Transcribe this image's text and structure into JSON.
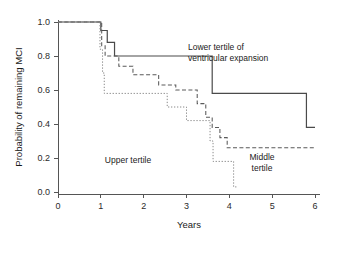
{
  "chart_data": {
    "type": "line",
    "title": "",
    "subtitle": "",
    "xlabel": "Years",
    "ylabel": "Probability of remaining MCI",
    "xlim": [
      0,
      6.3
    ],
    "ylim": [
      0,
      1.05
    ],
    "xticks": [
      0,
      1,
      2,
      3,
      4,
      5,
      6
    ],
    "xtick_labels": [
      "0",
      "1",
      "2",
      "3",
      "4",
      "5",
      "6"
    ],
    "yticks": [
      0.0,
      0.2,
      0.4,
      0.6,
      0.8,
      1.0
    ],
    "ytick_labels": [
      "0.0",
      "0.2",
      "0.4",
      "0.6",
      "0.8",
      "1.0"
    ],
    "grid": false,
    "legend_position": "inline-annotations",
    "curve_style": "kaplan-meier-step",
    "series": [
      {
        "name": "Lower tertile of ventricular expansion",
        "style": "solid",
        "color": "#4a4a4a",
        "label_text": "Lower tertile of\nventricular expansion",
        "label_line1": "Lower tertile of",
        "label_line2": "ventricular expansion",
        "points": [
          [
            0.0,
            1.0
          ],
          [
            1.0,
            1.0
          ],
          [
            1.0,
            0.95
          ],
          [
            1.15,
            0.95
          ],
          [
            1.15,
            0.88
          ],
          [
            1.32,
            0.88
          ],
          [
            1.32,
            0.8
          ],
          [
            3.6,
            0.8
          ],
          [
            3.6,
            0.58
          ],
          [
            5.8,
            0.58
          ],
          [
            5.8,
            0.38
          ],
          [
            6.0,
            0.38
          ]
        ]
      },
      {
        "name": "Middle tertile",
        "style": "dashed",
        "color": "#5a5a5a",
        "label_text": "Middle\ntertile",
        "label_line1": "Middle",
        "label_line2": "tertile",
        "points": [
          [
            0.0,
            1.0
          ],
          [
            1.02,
            1.0
          ],
          [
            1.02,
            0.86
          ],
          [
            1.1,
            0.86
          ],
          [
            1.1,
            0.8
          ],
          [
            1.42,
            0.8
          ],
          [
            1.42,
            0.74
          ],
          [
            1.75,
            0.74
          ],
          [
            1.75,
            0.69
          ],
          [
            2.35,
            0.69
          ],
          [
            2.35,
            0.63
          ],
          [
            2.75,
            0.63
          ],
          [
            2.75,
            0.6
          ],
          [
            3.25,
            0.6
          ],
          [
            3.25,
            0.52
          ],
          [
            3.45,
            0.52
          ],
          [
            3.45,
            0.44
          ],
          [
            3.6,
            0.44
          ],
          [
            3.6,
            0.38
          ],
          [
            3.78,
            0.38
          ],
          [
            3.78,
            0.32
          ],
          [
            3.95,
            0.32
          ],
          [
            3.95,
            0.26
          ],
          [
            6.0,
            0.26
          ]
        ]
      },
      {
        "name": "Upper tertile",
        "style": "dotted",
        "color": "#8a8a8a",
        "label_text": "Upper tertile",
        "label_line1": "Upper tertile",
        "label_line2": "",
        "points": [
          [
            0.0,
            1.0
          ],
          [
            0.98,
            1.0
          ],
          [
            0.98,
            0.84
          ],
          [
            1.04,
            0.84
          ],
          [
            1.04,
            0.7
          ],
          [
            1.08,
            0.7
          ],
          [
            1.08,
            0.58
          ],
          [
            2.55,
            0.58
          ],
          [
            2.55,
            0.5
          ],
          [
            3.0,
            0.5
          ],
          [
            3.0,
            0.42
          ],
          [
            3.55,
            0.42
          ],
          [
            3.55,
            0.3
          ],
          [
            3.62,
            0.3
          ],
          [
            3.62,
            0.18
          ],
          [
            4.1,
            0.18
          ],
          [
            4.1,
            0.03
          ],
          [
            4.2,
            0.03
          ]
        ]
      }
    ],
    "annotations": [
      {
        "text": "Lower tertile of ventricular expansion",
        "x": 3.1,
        "y": 0.9
      },
      {
        "text": "Upper tertile",
        "x": 1.85,
        "y": 0.37
      },
      {
        "text": "Middle tertile",
        "x": 4.55,
        "y": 0.2
      }
    ]
  },
  "colors": {
    "background": "#ffffff",
    "axis": "#555555",
    "text": "#1a1a1a",
    "solid_series": "#4a4a4a",
    "dashed_series": "#5a5a5a",
    "dotted_series": "#8a8a8a"
  }
}
